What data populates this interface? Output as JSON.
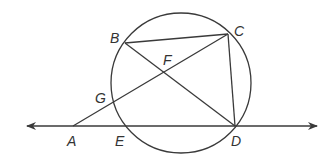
{
  "diagram": {
    "type": "circle geometry figure",
    "colors": {
      "stroke": "#3a3a3a",
      "label": "#333333",
      "background": "#ffffff"
    },
    "circle": {
      "cx": 181,
      "cy": 83,
      "r": 70
    },
    "points": {
      "A": {
        "label": "A",
        "x": 73,
        "y": 126,
        "lx": 67,
        "ly": 146
      },
      "B": {
        "label": "B",
        "x": 125,
        "y": 43,
        "lx": 110,
        "ly": 43
      },
      "C": {
        "label": "C",
        "x": 228,
        "y": 34,
        "lx": 234,
        "ly": 36
      },
      "D": {
        "label": "D",
        "x": 235,
        "y": 126,
        "lx": 231,
        "ly": 146
      },
      "E": {
        "label": "E",
        "x": 126,
        "y": 126,
        "lx": 115,
        "ly": 146
      },
      "F": {
        "label": "F",
        "x": 164,
        "y": 73,
        "lx": 163,
        "ly": 65
      },
      "G": {
        "label": "G",
        "x": 115,
        "y": 102,
        "lx": 95,
        "ly": 103
      }
    },
    "line": {
      "name": "line AD",
      "x1": 27,
      "x2": 317,
      "y": 126,
      "arrows": "both"
    },
    "segments": [
      {
        "name": "BC",
        "from": "B",
        "to": "C"
      },
      {
        "name": "BD",
        "from": "B",
        "to": "D"
      },
      {
        "name": "CD",
        "from": "C",
        "to": "D"
      },
      {
        "name": "AC",
        "from": "A",
        "to": "C"
      }
    ],
    "labels": [
      "A",
      "B",
      "C",
      "D",
      "E",
      "F",
      "G"
    ]
  }
}
